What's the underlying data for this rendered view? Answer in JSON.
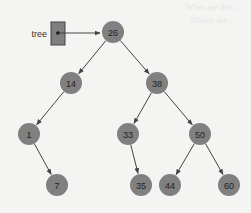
{
  "background": "#f4f4f2",
  "ghost_text": [
    "What are the ...",
    "Which are ..."
  ],
  "pointer": {
    "label": "tree",
    "box_color": "#7f7f7f",
    "box_border": "#444444"
  },
  "node_style": {
    "fill": "#808080",
    "text_color": "#222222",
    "radius": 11
  },
  "edge_color": "#444444",
  "tree": {
    "root": "26",
    "nodes": [
      {
        "id": "n26",
        "value": "26",
        "x": 113,
        "y": 32
      },
      {
        "id": "n14",
        "value": "14",
        "x": 71,
        "y": 83
      },
      {
        "id": "n38",
        "value": "38",
        "x": 157,
        "y": 83
      },
      {
        "id": "n1",
        "value": "1",
        "x": 29,
        "y": 134
      },
      {
        "id": "n33",
        "value": "33",
        "x": 128,
        "y": 134
      },
      {
        "id": "n50",
        "value": "50",
        "x": 200,
        "y": 134
      },
      {
        "id": "n7",
        "value": "7",
        "x": 57,
        "y": 185
      },
      {
        "id": "n35",
        "value": "35",
        "x": 141,
        "y": 185
      },
      {
        "id": "n44",
        "value": "44",
        "x": 170,
        "y": 185
      },
      {
        "id": "n60",
        "value": "60",
        "x": 229,
        "y": 185
      }
    ],
    "edges": [
      {
        "from": "n26",
        "to": "n14"
      },
      {
        "from": "n26",
        "to": "n38"
      },
      {
        "from": "n14",
        "to": "n1"
      },
      {
        "from": "n1",
        "to": "n7"
      },
      {
        "from": "n38",
        "to": "n33"
      },
      {
        "from": "n38",
        "to": "n50"
      },
      {
        "from": "n33",
        "to": "n35"
      },
      {
        "from": "n50",
        "to": "n44"
      },
      {
        "from": "n50",
        "to": "n60"
      }
    ]
  }
}
